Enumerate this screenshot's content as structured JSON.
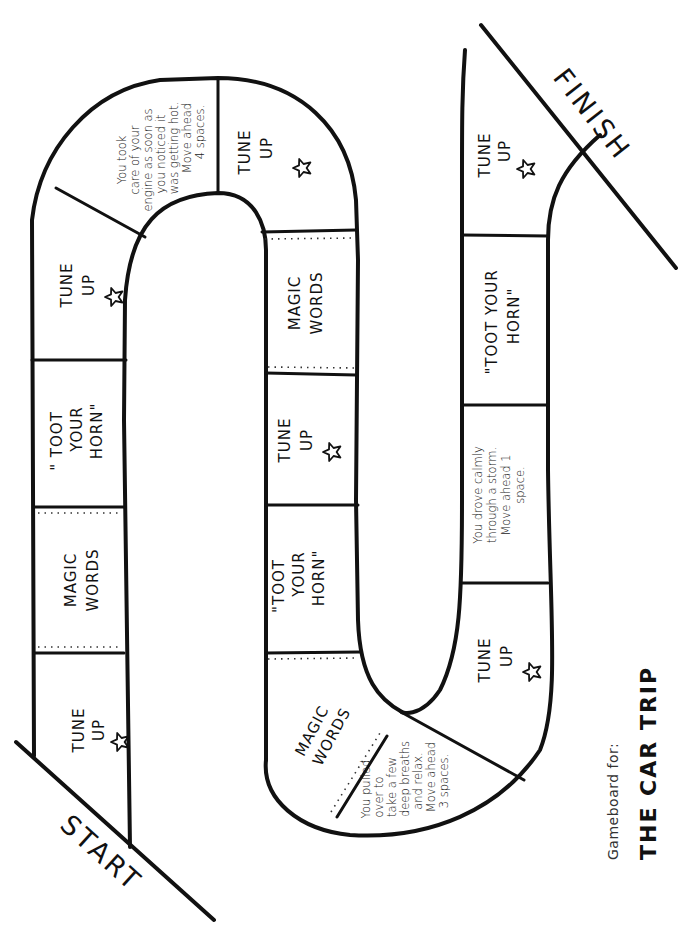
{
  "board": {
    "start_label": "START",
    "finish_label": "FINISH",
    "caption": {
      "subtitle": "Gameboard for:",
      "title": "THE CAR TRIP"
    },
    "spaces": [
      {
        "index": 1,
        "type": "tune_up",
        "lines": [
          "TUNE",
          "UP"
        ],
        "icon": "star-icon"
      },
      {
        "index": 2,
        "type": "magic_words",
        "lines": [
          "MAGIC",
          "WORDS"
        ]
      },
      {
        "index": 3,
        "type": "toot_horn",
        "lines": [
          "\" TOOT",
          "YOUR",
          "HORN\""
        ]
      },
      {
        "index": 4,
        "type": "tune_up",
        "lines": [
          "TUNE",
          "UP"
        ],
        "icon": "star-icon"
      },
      {
        "index": 5,
        "type": "bonus",
        "lines": [
          "You took",
          "care of your",
          "engine as soon as",
          "you noticed it",
          "was getting hot.",
          "Move ahead",
          "4 spaces."
        ]
      },
      {
        "index": 6,
        "type": "tune_up",
        "lines": [
          "TUNE",
          "UP"
        ],
        "icon": "star-icon"
      },
      {
        "index": 7,
        "type": "magic_words",
        "lines": [
          "MAGIC",
          "WORDS"
        ]
      },
      {
        "index": 8,
        "type": "tune_up",
        "lines": [
          "TUNE",
          "UP"
        ],
        "icon": "star-icon"
      },
      {
        "index": 9,
        "type": "toot_horn",
        "lines": [
          "\"TOOT",
          "YOUR",
          "HORN\""
        ]
      },
      {
        "index": 10,
        "type": "magic_words",
        "lines": [
          "MAGIC",
          "WORDS"
        ]
      },
      {
        "index": 11,
        "type": "bonus",
        "lines": [
          "You pulled",
          "over to",
          "take a few",
          "deep breaths",
          "and relax.",
          "Move ahead",
          "3 spaces."
        ]
      },
      {
        "index": 12,
        "type": "tune_up",
        "lines": [
          "TUNE",
          "UP"
        ],
        "icon": "star-icon"
      },
      {
        "index": 13,
        "type": "bonus",
        "lines": [
          "You drove calmly",
          "through a storm.",
          "Move ahead 1",
          "space."
        ]
      },
      {
        "index": 14,
        "type": "toot_horn",
        "lines": [
          "\"TOOT YOUR",
          "HORN\""
        ]
      },
      {
        "index": 15,
        "type": "tune_up",
        "lines": [
          "TUNE",
          "UP"
        ],
        "icon": "star-icon"
      }
    ]
  },
  "colors": {
    "ink": "#111111",
    "paper": "#ffffff"
  }
}
